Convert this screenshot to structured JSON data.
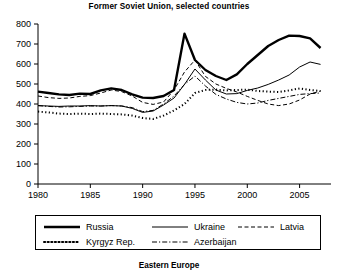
{
  "chart_data": {
    "type": "line",
    "title": "Former Soviet Union, selected countries",
    "footer_title": "Eastern Europe",
    "xlabel": "",
    "ylabel": "",
    "xlim": [
      1980,
      2008
    ],
    "ylim": [
      0,
      800
    ],
    "grid": false,
    "legend_position": "below-axes",
    "xticks": [
      1980,
      1985,
      1990,
      1995,
      2000,
      2005
    ],
    "xtick_labels": [
      "1980",
      "1985",
      "1990",
      "1995",
      "2000",
      "2005"
    ],
    "yticks": [
      0,
      100,
      200,
      300,
      400,
      500,
      600,
      700,
      800
    ],
    "ytick_labels": [
      "0",
      "100",
      "200",
      "300",
      "400",
      "500",
      "600",
      "700",
      "800"
    ],
    "x": [
      1980,
      1981,
      1982,
      1983,
      1984,
      1985,
      1986,
      1987,
      1988,
      1989,
      1990,
      1991,
      1992,
      1993,
      1994,
      1995,
      1996,
      1997,
      1998,
      1999,
      2000,
      2001,
      2002,
      2003,
      2004,
      2005,
      2006,
      2007
    ],
    "series": [
      {
        "name": "Russia",
        "style": "solid-thick",
        "stroke_width": 2.4,
        "dash": "none",
        "values": [
          462,
          455,
          448,
          445,
          452,
          450,
          468,
          478,
          470,
          448,
          432,
          430,
          440,
          470,
          752,
          620,
          570,
          540,
          520,
          548,
          600,
          645,
          690,
          720,
          742,
          740,
          728,
          680
        ]
      },
      {
        "name": "Ukraine",
        "style": "solid-thin",
        "stroke_width": 1.0,
        "dash": "none",
        "values": [
          392,
          390,
          388,
          390,
          390,
          392,
          390,
          392,
          390,
          378,
          358,
          365,
          395,
          430,
          498,
          575,
          520,
          470,
          450,
          452,
          468,
          480,
          498,
          520,
          545,
          585,
          610,
          598
        ]
      },
      {
        "name": "Latvia",
        "style": "dashed",
        "stroke_width": 1.0,
        "dash": "4,2.5",
        "values": [
          440,
          432,
          428,
          430,
          438,
          442,
          455,
          470,
          462,
          440,
          408,
          398,
          410,
          470,
          560,
          620,
          538,
          500,
          478,
          460,
          438,
          418,
          400,
          392,
          400,
          420,
          450,
          465
        ]
      },
      {
        "name": "Kyrgyz Rep.",
        "style": "dotted",
        "stroke_width": 2.0,
        "dash": "1.2,2.4",
        "values": [
          362,
          358,
          352,
          350,
          352,
          350,
          352,
          350,
          348,
          342,
          330,
          325,
          342,
          368,
          400,
          455,
          470,
          472,
          468,
          470,
          472,
          465,
          462,
          460,
          468,
          478,
          470,
          465
        ]
      },
      {
        "name": "Azerbaijan",
        "style": "dash-dot",
        "stroke_width": 1.0,
        "dash": "5,2,1.2,2",
        "values": [
          392,
          388,
          385,
          386,
          388,
          390,
          390,
          392,
          390,
          382,
          362,
          368,
          400,
          440,
          498,
          540,
          490,
          448,
          425,
          408,
          400,
          405,
          418,
          428,
          438,
          448,
          452,
          455
        ]
      }
    ],
    "legend": [
      {
        "name": "Russia",
        "style": "solid-thick"
      },
      {
        "name": "Ukraine",
        "style": "solid-thin"
      },
      {
        "name": "Latvia",
        "style": "dashed"
      },
      {
        "name": "Kyrgyz Rep.",
        "style": "dotted"
      },
      {
        "name": "Azerbaijan",
        "style": "dash-dot"
      }
    ],
    "colors": {
      "ink": "#000000",
      "background": "#ffffff"
    }
  }
}
